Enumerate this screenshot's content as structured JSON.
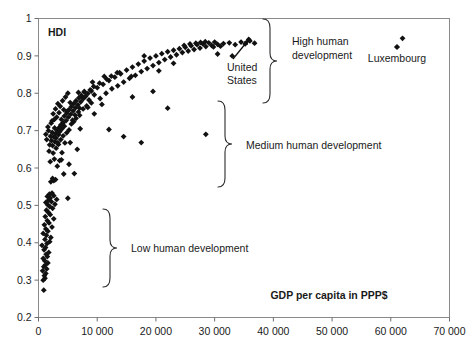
{
  "chart_data": {
    "type": "scatter",
    "title": "",
    "xlabel": "GDP per capita in PPP$",
    "ylabel": "HDI",
    "xlim": [
      0,
      70000
    ],
    "ylim": [
      0.2,
      1
    ],
    "grid": false,
    "legend_position": "top-right",
    "xticks": [
      "0",
      "10 000",
      "20 000",
      "30 000",
      "40 000",
      "50 000",
      "60 000",
      "70 000"
    ],
    "xtick_values": [
      0,
      10000,
      20000,
      30000,
      40000,
      50000,
      60000,
      70000
    ],
    "yticks": [
      "0.2",
      "0.3",
      "0.4",
      "0.5",
      "0.6",
      "0.7",
      "0.8",
      "0.9",
      "1"
    ],
    "ytick_values": [
      0.2,
      0.3,
      0.4,
      0.5,
      0.6,
      0.7,
      0.8,
      0.9,
      1.0
    ],
    "series": [
      {
        "name": "Countries",
        "marker": "diamond",
        "color": "#111111",
        "points": [
          [
            900,
            0.273
          ],
          [
            800,
            0.3
          ],
          [
            1100,
            0.305
          ],
          [
            1000,
            0.312
          ],
          [
            1250,
            0.318
          ],
          [
            700,
            0.325
          ],
          [
            1400,
            0.33
          ],
          [
            900,
            0.336
          ],
          [
            1200,
            0.341
          ],
          [
            1600,
            0.346
          ],
          [
            1050,
            0.352
          ],
          [
            800,
            0.358
          ],
          [
            1500,
            0.363
          ],
          [
            1300,
            0.369
          ],
          [
            1750,
            0.374
          ],
          [
            950,
            0.381
          ],
          [
            1200,
            0.387
          ],
          [
            600,
            0.393
          ],
          [
            1450,
            0.398
          ],
          [
            1900,
            0.403
          ],
          [
            1100,
            0.409
          ],
          [
            2100,
            0.414
          ],
          [
            1350,
            0.42
          ],
          [
            800,
            0.425
          ],
          [
            1600,
            0.431
          ],
          [
            1250,
            0.437
          ],
          [
            2300,
            0.442
          ],
          [
            1000,
            0.448
          ],
          [
            1800,
            0.453
          ],
          [
            1500,
            0.459
          ],
          [
            2600,
            0.464
          ],
          [
            1150,
            0.47
          ],
          [
            2000,
            0.475
          ],
          [
            1700,
            0.481
          ],
          [
            1350,
            0.487
          ],
          [
            2400,
            0.492
          ],
          [
            1900,
            0.497
          ],
          [
            1550,
            0.502
          ],
          [
            2800,
            0.503
          ],
          [
            1250,
            0.508
          ],
          [
            2200,
            0.51
          ],
          [
            1700,
            0.514
          ],
          [
            3100,
            0.516
          ],
          [
            2000,
            0.52
          ],
          [
            5000,
            0.519
          ],
          [
            1500,
            0.524
          ],
          [
            2600,
            0.526
          ],
          [
            1850,
            0.53
          ],
          [
            2300,
            0.533
          ],
          [
            2100,
            0.563
          ],
          [
            2600,
            0.566
          ],
          [
            2900,
            0.569
          ],
          [
            2400,
            0.572
          ],
          [
            4300,
            0.584
          ],
          [
            3200,
            0.605
          ],
          [
            6100,
            0.585
          ],
          [
            2000,
            0.617
          ],
          [
            3600,
            0.62
          ],
          [
            5200,
            0.61
          ],
          [
            2700,
            0.624
          ],
          [
            4000,
            0.641
          ],
          [
            1800,
            0.645
          ],
          [
            3000,
            0.653
          ],
          [
            6600,
            0.65
          ],
          [
            2400,
            0.66
          ],
          [
            3400,
            0.663
          ],
          [
            4500,
            0.667
          ],
          [
            2800,
            0.67
          ],
          [
            5400,
            0.668
          ],
          [
            2200,
            0.673
          ],
          [
            3800,
            0.676
          ],
          [
            3000,
            0.68
          ],
          [
            2600,
            0.683
          ],
          [
            4200,
            0.686
          ],
          [
            3400,
            0.689
          ],
          [
            2900,
            0.692
          ],
          [
            4800,
            0.694
          ],
          [
            3600,
            0.697
          ],
          [
            3200,
            0.7
          ],
          [
            5200,
            0.702
          ],
          [
            4000,
            0.705
          ],
          [
            3500,
            0.708
          ],
          [
            7100,
            0.705
          ],
          [
            4400,
            0.712
          ],
          [
            3800,
            0.715
          ],
          [
            5600,
            0.718
          ],
          [
            4200,
            0.721
          ],
          [
            6000,
            0.724
          ],
          [
            4700,
            0.727
          ],
          [
            3900,
            0.73
          ],
          [
            6400,
            0.733
          ],
          [
            5100,
            0.736
          ],
          [
            4400,
            0.739
          ],
          [
            7000,
            0.741
          ],
          [
            5500,
            0.744
          ],
          [
            4800,
            0.747
          ],
          [
            6800,
            0.75
          ],
          [
            5900,
            0.753
          ],
          [
            5200,
            0.756
          ],
          [
            7600,
            0.758
          ],
          [
            6300,
            0.761
          ],
          [
            5600,
            0.764
          ],
          [
            8200,
            0.766
          ],
          [
            6700,
            0.769
          ],
          [
            6000,
            0.772
          ],
          [
            9000,
            0.774
          ],
          [
            7200,
            0.777
          ],
          [
            6400,
            0.78
          ],
          [
            8600,
            0.782
          ],
          [
            7600,
            0.785
          ],
          [
            6900,
            0.788
          ],
          [
            10500,
            0.786
          ],
          [
            8000,
            0.791
          ],
          [
            7300,
            0.794
          ],
          [
            9500,
            0.796
          ],
          [
            8400,
            0.799
          ],
          [
            11500,
            0.8
          ],
          [
            7800,
            0.803
          ],
          [
            9000,
            0.806
          ],
          [
            8800,
            0.809
          ],
          [
            12500,
            0.812
          ],
          [
            10000,
            0.815
          ],
          [
            9400,
            0.818
          ],
          [
            13500,
            0.82
          ],
          [
            11000,
            0.824
          ],
          [
            10400,
            0.827
          ],
          [
            14500,
            0.83
          ],
          [
            12000,
            0.834
          ],
          [
            11600,
            0.838
          ],
          [
            15500,
            0.84
          ],
          [
            13000,
            0.843
          ],
          [
            12400,
            0.846
          ],
          [
            16500,
            0.848
          ],
          [
            14000,
            0.852
          ],
          [
            13400,
            0.855
          ],
          [
            17500,
            0.858
          ],
          [
            15000,
            0.862
          ],
          [
            18500,
            0.866
          ],
          [
            16000,
            0.87
          ],
          [
            19500,
            0.874
          ],
          [
            17000,
            0.878
          ],
          [
            20500,
            0.882
          ],
          [
            18000,
            0.886
          ],
          [
            21500,
            0.89
          ],
          [
            19000,
            0.894
          ],
          [
            22500,
            0.897
          ],
          [
            20000,
            0.9
          ],
          [
            23500,
            0.903
          ],
          [
            21000,
            0.906
          ],
          [
            24500,
            0.909
          ],
          [
            22000,
            0.911
          ],
          [
            25500,
            0.913
          ],
          [
            23000,
            0.915
          ],
          [
            26500,
            0.917
          ],
          [
            24000,
            0.919
          ],
          [
            27500,
            0.921
          ],
          [
            25000,
            0.923
          ],
          [
            28500,
            0.925
          ],
          [
            26000,
            0.927
          ],
          [
            29500,
            0.928
          ],
          [
            27000,
            0.93
          ],
          [
            30500,
            0.931
          ],
          [
            28000,
            0.932
          ],
          [
            31500,
            0.933
          ],
          [
            26800,
            0.934
          ],
          [
            29000,
            0.935
          ],
          [
            27600,
            0.936
          ],
          [
            30000,
            0.937
          ],
          [
            28400,
            0.938
          ],
          [
            25800,
            0.932
          ],
          [
            24800,
            0.928
          ],
          [
            32500,
            0.935
          ],
          [
            33500,
            0.93
          ],
          [
            29800,
            0.924
          ],
          [
            31000,
            0.926
          ],
          [
            34500,
            0.937
          ],
          [
            36000,
            0.94
          ],
          [
            35200,
            0.932
          ],
          [
            36800,
            0.934
          ],
          [
            35800,
            0.944
          ],
          [
            30500,
            0.905
          ],
          [
            33000,
            0.9
          ],
          [
            12000,
            0.703
          ],
          [
            14500,
            0.684
          ],
          [
            17500,
            0.668
          ],
          [
            9500,
            0.745
          ],
          [
            22000,
            0.76
          ],
          [
            10800,
            0.77
          ],
          [
            28500,
            0.69
          ],
          [
            19500,
            0.805
          ],
          [
            16000,
            0.79
          ],
          [
            7800,
            0.805
          ],
          [
            9200,
            0.83
          ],
          [
            11200,
            0.845
          ],
          [
            13800,
            0.855
          ],
          [
            15800,
            0.845
          ],
          [
            18000,
            0.9
          ],
          [
            20500,
            0.86
          ],
          [
            23000,
            0.88
          ],
          [
            7000,
            0.76
          ],
          [
            4900,
            0.752
          ],
          [
            6200,
            0.742
          ],
          [
            5800,
            0.728
          ],
          [
            3300,
            0.668
          ],
          [
            2500,
            0.64
          ],
          [
            3900,
            0.622
          ],
          [
            1700,
            0.7
          ],
          [
            2050,
            0.685
          ],
          [
            2350,
            0.695
          ],
          [
            1400,
            0.676
          ],
          [
            1900,
            0.662
          ],
          [
            2750,
            0.707
          ],
          [
            1250,
            0.69
          ],
          [
            1600,
            0.71
          ],
          [
            2150,
            0.72
          ],
          [
            6800,
            0.802
          ],
          [
            8400,
            0.762
          ],
          [
            5400,
            0.775
          ],
          [
            4600,
            0.79
          ],
          [
            3700,
            0.765
          ],
          [
            4100,
            0.78
          ],
          [
            3300,
            0.772
          ],
          [
            2900,
            0.758
          ],
          [
            5000,
            0.8
          ],
          [
            2500,
            0.745
          ],
          [
            3100,
            0.736
          ],
          [
            2700,
            0.73
          ],
          [
            3500,
            0.748
          ],
          [
            4300,
            0.756
          ],
          [
            2300,
            0.726
          ]
        ]
      }
    ],
    "annotations": [
      {
        "id": "high-human-development",
        "text": "High human development",
        "lines": [
          "High human",
          "development"
        ]
      },
      {
        "id": "medium-human-development",
        "text": "Medium human development",
        "lines": [
          "Medium human development"
        ]
      },
      {
        "id": "low-human-development",
        "text": "Low human development",
        "lines": [
          "Low human development"
        ]
      },
      {
        "id": "united-states",
        "text": "United States",
        "lines": [
          "United",
          "States"
        ],
        "point": [
          36000,
          0.94
        ]
      }
    ],
    "legend": [
      {
        "label": "Luxembourg",
        "marker": "diamond",
        "color": "#111111",
        "point": [
          62000,
          0.947
        ]
      }
    ]
  },
  "axes": {
    "y_title": "HDI",
    "x_title": "GDP per capita in PPP$"
  }
}
